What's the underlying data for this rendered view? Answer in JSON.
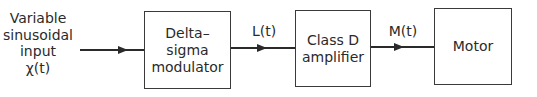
{
  "diagram": {
    "type": "block-diagram",
    "input": {
      "label": "Variable\nsinusoidal\ninput\nχ(t)"
    },
    "blocks": [
      {
        "id": "dsm",
        "label": "Delta–\nsigma\nmodulator"
      },
      {
        "id": "amp",
        "label": "Class D\namplifier"
      },
      {
        "id": "motor",
        "label": "Motor"
      }
    ],
    "signals": [
      {
        "from": "input",
        "to": "dsm",
        "label": ""
      },
      {
        "from": "dsm",
        "to": "amp",
        "label": "L(t)"
      },
      {
        "from": "amp",
        "to": "motor",
        "label": "M(t)"
      }
    ]
  }
}
